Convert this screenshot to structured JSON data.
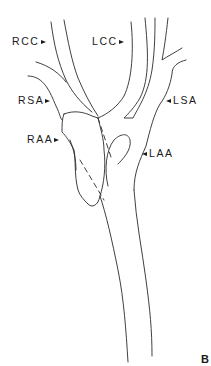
{
  "figure": {
    "panel_label": "B",
    "line_color": "#2a2a2a",
    "background": "#ffffff",
    "labels": [
      {
        "id": "rcc",
        "text": "RCC",
        "arrow": "right",
        "full_name": null
      },
      {
        "id": "lcc",
        "text": "LCC",
        "arrow": "right"
      },
      {
        "id": "rsa",
        "text": "RSA",
        "arrow": "right"
      },
      {
        "id": "lsa",
        "text": "LSA",
        "arrow": "left"
      },
      {
        "id": "raa",
        "text": "RAA",
        "arrow": "right"
      },
      {
        "id": "laa",
        "text": "LAA",
        "arrow": "left"
      }
    ]
  }
}
